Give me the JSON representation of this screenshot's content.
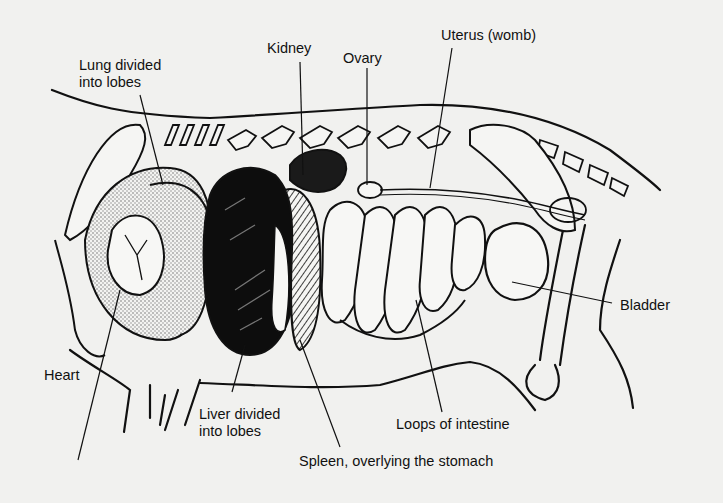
{
  "figure": {
    "labels": [
      {
        "id": "lung",
        "line1": "Lung divided",
        "line2": "into lobes"
      },
      {
        "id": "kidney",
        "line1": "Kidney"
      },
      {
        "id": "ovary",
        "line1": "Ovary"
      },
      {
        "id": "uterus",
        "line1": "Uterus (womb)"
      },
      {
        "id": "bladder",
        "line1": "Bladder"
      },
      {
        "id": "heart",
        "line1": "Heart"
      },
      {
        "id": "liver",
        "line1": "Liver divided",
        "line2": "into lobes"
      },
      {
        "id": "intestine",
        "line1": "Loops of intestine"
      },
      {
        "id": "spleen",
        "line1": "Spleen, overlying the stomach"
      }
    ]
  },
  "colors": {
    "background": "#f1f1ef",
    "ink": "#111111",
    "liver": "#0d0d0d",
    "lung_fill": "#d9d9d6"
  }
}
